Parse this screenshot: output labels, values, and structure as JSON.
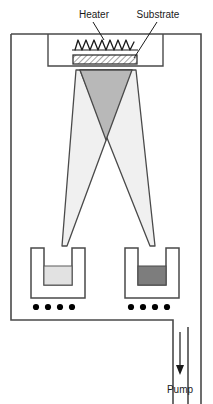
{
  "figure": {
    "background_color": "#ffffff",
    "line_color": "#3a3a3a",
    "labels": {
      "heater": "Heater",
      "substrate": "Substrate",
      "pump": "Pump"
    },
    "chamber": {
      "outline_color": "#4a4a4a",
      "fill": "#ffffff"
    },
    "heater": {
      "name": "heater-coil",
      "zigzag_peaks": 8,
      "color": "#1a1a1a"
    },
    "substrate": {
      "name": "substrate-plate",
      "hatch_color": "#555555",
      "fill": "#ffffff"
    },
    "plumes": [
      {
        "name": "plume-left-source",
        "fill": "#f0f0f0",
        "stroke": "#4a4a4a",
        "source": "left-crucible"
      },
      {
        "name": "plume-right-source",
        "fill": "#f0f0f0",
        "stroke": "#4a4a4a",
        "source": "right-crucible"
      }
    ],
    "plume_overlap": {
      "name": "plume-overlap-region",
      "fill": "#b8b8b8",
      "stroke": "#4a4a4a"
    },
    "crucibles": [
      {
        "name": "crucible-left",
        "melt_fill": "#e2e2e2",
        "wall_color": "#4a4a4a",
        "heater_dots": 4,
        "dot_color": "#000000"
      },
      {
        "name": "crucible-right",
        "melt_fill": "#7d7d7d",
        "wall_color": "#4a4a4a",
        "heater_dots": 4,
        "dot_color": "#000000"
      }
    ],
    "pump_outlet": {
      "name": "pump-duct",
      "arrow_color": "#1a1a1a",
      "direction": "down"
    }
  }
}
